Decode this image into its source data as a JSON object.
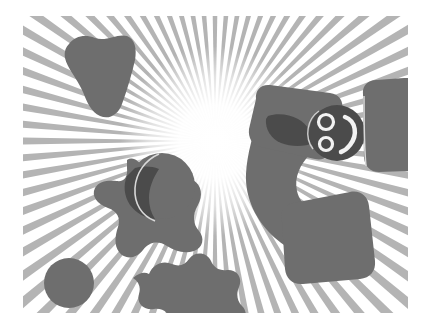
{
  "canvas": {
    "width": 429,
    "height": 332,
    "background_color": "#ffffff",
    "artboard": {
      "x": 23,
      "y": 16,
      "width": 385,
      "height": 297,
      "background_color": "#ffffff"
    },
    "title": "abstract radial burst with scattered gray shapes"
  },
  "palette": {
    "background": "#ffffff",
    "ray": "#b4b4b4",
    "glow_core": "#ffffff",
    "shape_fill": "#6e6e6e",
    "shape_fill_dark": "#4b4b4b",
    "shape_edge_light": "#d8d8d8",
    "hole_fill": "#f2f2f2"
  },
  "burst": {
    "name": "radial-sunburst",
    "center_x": 215,
    "center_y": 141,
    "ray_count": 72,
    "ray_color": "#b4b4b4",
    "ray_angular_width_deg": 2.1,
    "radius": 620,
    "glow": {
      "center_x": 215,
      "center_y": 141,
      "radius": 95,
      "core_color": "#ffffff"
    }
  },
  "shapes": [
    {
      "name": "shape-wedge-top-left",
      "kind": "blob",
      "fill": "#6e6e6e",
      "cx": 88,
      "cy": 58
    },
    {
      "name": "shape-star-left",
      "kind": "star",
      "fill": "#6e6e6e",
      "cx": 125,
      "cy": 195
    },
    {
      "name": "shape-circle-mid-left",
      "kind": "circle",
      "fill": "#6e6e6e",
      "cx": 162,
      "cy": 186,
      "r": 33
    },
    {
      "name": "shape-circle-bottom-left",
      "kind": "circle",
      "fill": "#6e6e6e",
      "cx": 69,
      "cy": 283,
      "r": 25
    },
    {
      "name": "shape-cloud-bottom",
      "kind": "blob",
      "fill": "#6e6e6e",
      "cx": 160,
      "cy": 295
    },
    {
      "name": "shape-bean-center",
      "kind": "blob",
      "fill": "#6e6e6e",
      "cx": 272,
      "cy": 175
    },
    {
      "name": "shape-square-top-right",
      "kind": "rounded-square",
      "fill": "#6e6e6e",
      "cx": 296,
      "cy": 108
    },
    {
      "name": "shape-face-right",
      "kind": "face",
      "fill": "#4b4b4b",
      "cx": 337,
      "cy": 133,
      "r": 28
    },
    {
      "name": "shape-square-bottom-right",
      "kind": "rounded-square",
      "fill": "#6e6e6e",
      "cx": 318,
      "cy": 250
    },
    {
      "name": "shape-rect-far-right",
      "kind": "rounded-rect",
      "fill": "#6e6e6e",
      "cx": 390,
      "cy": 117
    }
  ]
}
